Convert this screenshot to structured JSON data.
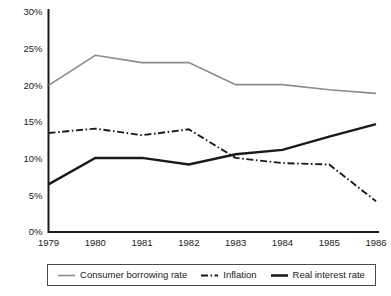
{
  "chart_data": {
    "type": "line",
    "title": "",
    "xlabel": "",
    "ylabel": "",
    "categories": [
      "1979",
      "1980",
      "1981",
      "1982",
      "1983",
      "1984",
      "1985",
      "1986"
    ],
    "x": [
      1979,
      1980,
      1981,
      1982,
      1983,
      1984,
      1985,
      1986
    ],
    "ylim": [
      0,
      30
    ],
    "yticks": [
      0,
      5,
      10,
      15,
      20,
      25,
      30
    ],
    "ytick_labels": [
      "0%",
      "5%",
      "10%",
      "15%",
      "20%",
      "25%",
      "30%"
    ],
    "grid": false,
    "legend_position": "bottom",
    "series": [
      {
        "name": "Consumer borrowing rate",
        "color": "#8c8c8c",
        "style": "solid",
        "width": 1.6,
        "values": [
          20.0,
          24.1,
          23.1,
          23.1,
          20.1,
          20.1,
          19.4,
          18.9
        ]
      },
      {
        "name": "Inflation",
        "color": "#1a1a1a",
        "style": "dashdot",
        "width": 1.9,
        "values": [
          13.5,
          14.1,
          13.2,
          14.0,
          10.1,
          9.4,
          9.2,
          4.2
        ]
      },
      {
        "name": "Real interest rate",
        "color": "#1a1a1a",
        "style": "solid",
        "width": 2.4,
        "values": [
          6.5,
          10.1,
          10.1,
          9.2,
          10.6,
          11.2,
          13.0,
          14.7
        ]
      }
    ]
  },
  "legend": {
    "items": [
      {
        "label": "Consumer borrowing rate"
      },
      {
        "label": "Inflation"
      },
      {
        "label": "Real interest rate"
      }
    ]
  },
  "axes": {
    "y_labels": [
      "30%",
      "25%",
      "20%",
      "15%",
      "10%",
      "5%",
      "0%"
    ],
    "x_labels": [
      "1979",
      "1980",
      "1981",
      "1982",
      "1983",
      "1984",
      "1985",
      "1986"
    ]
  }
}
